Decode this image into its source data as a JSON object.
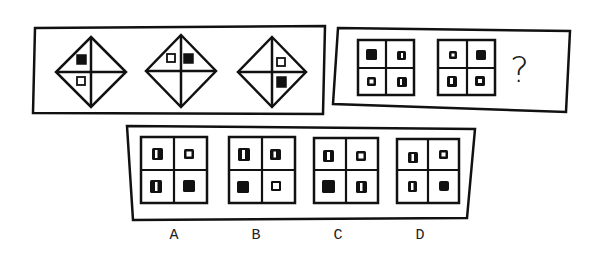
{
  "puzzle": {
    "question_mark": "?",
    "top_left_panel": {
      "figures": [
        {
          "type": "diamond-cross",
          "center": [
            91,
            72
          ],
          "marks": [
            {
              "quadrant": "upper-left",
              "slot": "upper",
              "fill": "black"
            },
            {
              "quadrant": "lower-left",
              "slot": "lower",
              "fill": "white"
            }
          ]
        },
        {
          "type": "diamond-cross",
          "center": [
            181,
            72
          ],
          "marks": [
            {
              "quadrant": "upper-left",
              "slot": "left",
              "fill": "white"
            },
            {
              "quadrant": "upper-right",
              "slot": "right",
              "fill": "black"
            }
          ]
        },
        {
          "type": "diamond-cross",
          "center": [
            272,
            72
          ],
          "marks": [
            {
              "quadrant": "upper-right",
              "slot": "upper",
              "fill": "white"
            },
            {
              "quadrant": "lower-right",
              "slot": "lower",
              "fill": "black"
            }
          ]
        }
      ]
    },
    "top_right_panel": {
      "grids": [
        {
          "cells": [
            "solid",
            "slit",
            "hollow",
            "slit"
          ]
        },
        {
          "cells": [
            "hollow",
            "solid",
            "slit",
            "window"
          ]
        }
      ]
    },
    "options": [
      {
        "label": "A",
        "cells": [
          "slit",
          "hollow",
          "slit",
          "solid"
        ]
      },
      {
        "label": "B",
        "cells": [
          "slit",
          "slit",
          "solid",
          "hollow"
        ]
      },
      {
        "label": "C",
        "cells": [
          "slit",
          "hollow",
          "solid",
          "slit"
        ]
      },
      {
        "label": "D",
        "cells": [
          "slit",
          "hollow",
          "slit",
          "solid"
        ]
      }
    ],
    "colors": {
      "ink": "#111111",
      "background": "#ffffff"
    }
  }
}
